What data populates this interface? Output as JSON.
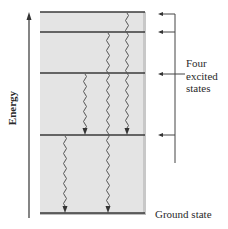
{
  "diagram": {
    "axis": {
      "label": "Energy",
      "direction": "up"
    },
    "levels": [
      {
        "name": "excited-1",
        "y": 12
      },
      {
        "name": "excited-2",
        "y": 32
      },
      {
        "name": "excited-3",
        "y": 73
      },
      {
        "name": "excited-4",
        "y": 135
      },
      {
        "name": "ground",
        "y": 213
      }
    ],
    "transitions": [
      {
        "from": "excited-1",
        "to": "excited-4",
        "x": 127
      },
      {
        "from": "excited-2",
        "to": "ground",
        "x": 108
      },
      {
        "from": "excited-3",
        "to": "excited-4",
        "x": 85
      },
      {
        "from": "excited-4",
        "to": "ground",
        "x": 65
      }
    ],
    "bracket_label": {
      "line1": "Four",
      "line2": "excited",
      "line3": "states"
    },
    "ground_label": "Ground state",
    "colors": {
      "panel": "#e4e4e4",
      "panel_shadow": "#c8c8c8",
      "line": "#3a3a3a"
    }
  }
}
